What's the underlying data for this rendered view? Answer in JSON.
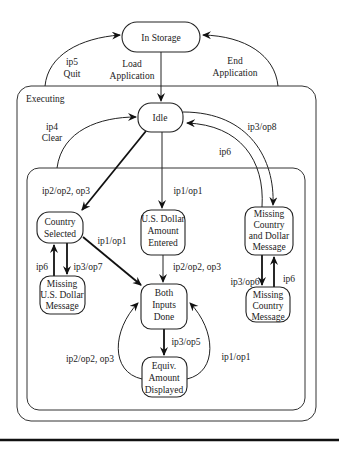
{
  "diagram": {
    "type": "state-diagram",
    "containers": {
      "executing": "Executing"
    },
    "states": {
      "in_storage": [
        "In Storage"
      ],
      "idle": [
        "Idle"
      ],
      "country_selected": [
        "Country",
        "Selected"
      ],
      "usd_entered": [
        "U.S. Dollar",
        "Amount",
        "Entered"
      ],
      "missing_both": [
        "Missing",
        "Country",
        "and Dollar",
        "Message"
      ],
      "missing_usd": [
        "Missing",
        "U.S. Dollar",
        "Message"
      ],
      "both_done": [
        "Both",
        "Inputs",
        "Done"
      ],
      "missing_country": [
        "Missing",
        "Country",
        "Message"
      ],
      "equiv_displayed": [
        "Equiv.",
        "Amount",
        "Displayed"
      ]
    },
    "transitions": {
      "quit": [
        "ip5",
        "Quit"
      ],
      "load": [
        "Load",
        "Application"
      ],
      "end": [
        "End",
        "Application"
      ],
      "clear": [
        "ip4",
        "Clear"
      ],
      "idle_to_missing_both": "ip3/op8",
      "missing_both_to_idle": "ip6",
      "idle_to_country": "ip2/op2, op3",
      "idle_to_usd": "ip1/op1",
      "country_to_both": "ip1/op1",
      "missing_usd_to_country": "ip6",
      "country_to_missing_usd": "ip3/op7",
      "usd_to_both": "ip2/op2, op3",
      "missing_both_to_missing_country": "ip3/op6",
      "missing_country_to_missing_both": "ip6",
      "both_to_equiv": "ip3/op5",
      "equiv_loop_left": "ip2/op2, op3",
      "equiv_loop_right": "ip1/op1"
    }
  }
}
